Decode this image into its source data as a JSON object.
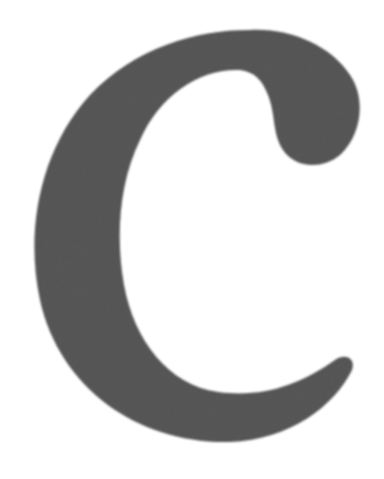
{
  "image": {
    "subject": "letter C",
    "letter": "C",
    "fill_color": "#5e5e5e",
    "texture": "felt",
    "background_color": "#ffffff"
  }
}
